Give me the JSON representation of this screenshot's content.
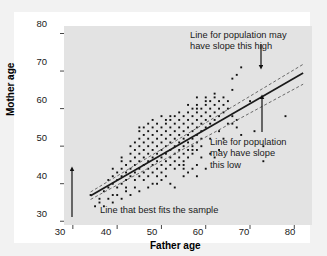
{
  "figure": {
    "panel_bg": "#e3e3e3",
    "card_bg": "#ffffff",
    "page_bg": "#f2f2f2"
  },
  "chart_data": {
    "type": "scatter",
    "title": "",
    "xlabel": "Father age",
    "ylabel": "Mother age",
    "xlim": [
      28,
      84
    ],
    "ylim": [
      29,
      82
    ],
    "xticks": [
      30,
      40,
      50,
      60,
      70,
      80
    ],
    "yticks": [
      30,
      40,
      50,
      60,
      70,
      80
    ],
    "grid": false,
    "legend": "none",
    "point_color": "#111111",
    "point_marker": "square",
    "annotations": [
      {
        "name": "upper-bound-label",
        "text": "Line for population may\nhave slope this high",
        "arrow": "down",
        "target": "upper-dashed-line"
      },
      {
        "name": "lower-bound-label",
        "text": "Line for population\nmay have slope\nthis low",
        "arrow": "up",
        "target": "lower-dashed-line"
      },
      {
        "name": "best-fit-label",
        "text": "Line that best fits the sample",
        "arrow": "up",
        "target": "regression-line"
      }
    ],
    "series": [
      {
        "name": "regression-line",
        "type": "line",
        "style": "solid",
        "color": "#1a1a1a",
        "x": [
          34,
          82
        ],
        "y": [
          36.8,
          69.5
        ]
      },
      {
        "name": "upper-dashed-line",
        "type": "line",
        "style": "dashed",
        "color": "#555555",
        "x": [
          34,
          82
        ],
        "y": [
          37.8,
          71.8
        ]
      },
      {
        "name": "lower-dashed-line",
        "type": "line",
        "style": "dashed",
        "color": "#555555",
        "x": [
          34,
          82
        ],
        "y": [
          35.8,
          66.5
        ]
      },
      {
        "name": "father-mother-age-points",
        "type": "scatter",
        "points": [
          [
            34,
            37
          ],
          [
            35,
            34
          ],
          [
            36,
            36
          ],
          [
            37,
            38
          ],
          [
            38,
            39
          ],
          [
            38,
            41
          ],
          [
            39,
            40
          ],
          [
            39,
            42
          ],
          [
            39,
            37
          ],
          [
            40,
            41
          ],
          [
            40,
            43
          ],
          [
            40,
            39
          ],
          [
            41,
            42
          ],
          [
            41,
            44
          ],
          [
            41,
            40
          ],
          [
            41,
            46
          ],
          [
            42,
            43
          ],
          [
            42,
            45
          ],
          [
            42,
            41
          ],
          [
            42,
            39
          ],
          [
            43,
            44
          ],
          [
            43,
            46
          ],
          [
            43,
            42
          ],
          [
            43,
            48
          ],
          [
            44,
            45
          ],
          [
            44,
            43
          ],
          [
            44,
            47
          ],
          [
            44,
            41
          ],
          [
            44,
            49
          ],
          [
            45,
            46
          ],
          [
            45,
            44
          ],
          [
            45,
            48
          ],
          [
            45,
            42
          ],
          [
            45,
            50
          ],
          [
            45,
            52
          ],
          [
            45,
            55
          ],
          [
            46,
            47
          ],
          [
            46,
            45
          ],
          [
            46,
            49
          ],
          [
            46,
            43
          ],
          [
            46,
            51
          ],
          [
            46,
            53
          ],
          [
            47,
            48
          ],
          [
            47,
            46
          ],
          [
            47,
            50
          ],
          [
            47,
            44
          ],
          [
            47,
            52
          ],
          [
            47,
            42
          ],
          [
            47,
            54
          ],
          [
            48,
            49
          ],
          [
            48,
            47
          ],
          [
            48,
            51
          ],
          [
            48,
            45
          ],
          [
            48,
            53
          ],
          [
            48,
            43
          ],
          [
            48,
            55
          ],
          [
            49,
            50
          ],
          [
            49,
            48
          ],
          [
            49,
            52
          ],
          [
            49,
            46
          ],
          [
            49,
            54
          ],
          [
            49,
            44
          ],
          [
            49,
            42
          ],
          [
            50,
            51
          ],
          [
            50,
            49
          ],
          [
            50,
            53
          ],
          [
            50,
            47
          ],
          [
            50,
            55
          ],
          [
            50,
            45
          ],
          [
            50,
            43
          ],
          [
            51,
            52
          ],
          [
            51,
            50
          ],
          [
            51,
            54
          ],
          [
            51,
            48
          ],
          [
            51,
            56
          ],
          [
            51,
            46
          ],
          [
            51,
            44
          ],
          [
            52,
            53
          ],
          [
            52,
            51
          ],
          [
            52,
            55
          ],
          [
            52,
            49
          ],
          [
            52,
            47
          ],
          [
            52,
            45
          ],
          [
            52,
            57
          ],
          [
            53,
            54
          ],
          [
            53,
            52
          ],
          [
            53,
            56
          ],
          [
            53,
            50
          ],
          [
            53,
            48
          ],
          [
            53,
            46
          ],
          [
            53,
            58
          ],
          [
            54,
            55
          ],
          [
            54,
            53
          ],
          [
            54,
            57
          ],
          [
            54,
            51
          ],
          [
            54,
            49
          ],
          [
            54,
            47
          ],
          [
            54,
            45
          ],
          [
            55,
            56
          ],
          [
            55,
            54
          ],
          [
            55,
            58
          ],
          [
            55,
            52
          ],
          [
            55,
            50
          ],
          [
            55,
            48
          ],
          [
            55,
            46
          ],
          [
            55,
            44
          ],
          [
            56,
            57
          ],
          [
            56,
            55
          ],
          [
            56,
            53
          ],
          [
            56,
            51
          ],
          [
            56,
            49
          ],
          [
            56,
            47
          ],
          [
            56,
            59
          ],
          [
            57,
            58
          ],
          [
            57,
            56
          ],
          [
            57,
            54
          ],
          [
            57,
            52
          ],
          [
            57,
            50
          ],
          [
            57,
            48
          ],
          [
            57,
            60
          ],
          [
            58,
            59
          ],
          [
            58,
            57
          ],
          [
            58,
            55
          ],
          [
            58,
            53
          ],
          [
            58,
            51
          ],
          [
            58,
            49
          ],
          [
            58,
            61
          ],
          [
            58,
            63
          ],
          [
            58,
            45
          ],
          [
            58,
            42
          ],
          [
            59,
            58
          ],
          [
            59,
            56
          ],
          [
            59,
            54
          ],
          [
            59,
            60
          ],
          [
            59,
            52
          ],
          [
            60,
            59
          ],
          [
            60,
            57
          ],
          [
            60,
            61
          ],
          [
            60,
            55
          ],
          [
            60,
            62
          ],
          [
            61,
            60
          ],
          [
            61,
            58
          ],
          [
            61,
            56
          ],
          [
            61,
            62
          ],
          [
            62,
            61
          ],
          [
            62,
            59
          ],
          [
            62,
            57
          ],
          [
            62,
            63
          ],
          [
            63,
            62
          ],
          [
            63,
            60
          ],
          [
            63,
            58
          ],
          [
            64,
            63
          ],
          [
            64,
            61
          ],
          [
            64,
            59
          ],
          [
            65,
            62
          ],
          [
            65,
            60
          ],
          [
            66,
            65
          ],
          [
            66,
            58
          ],
          [
            67,
            69
          ],
          [
            67,
            55
          ],
          [
            68,
            71
          ],
          [
            68,
            53
          ],
          [
            70,
            62
          ],
          [
            71,
            54
          ],
          [
            73,
            50
          ],
          [
            73,
            46
          ],
          [
            78,
            58
          ],
          [
            60,
            44
          ],
          [
            62,
            47
          ],
          [
            63,
            49
          ],
          [
            59,
            47
          ],
          [
            57,
            44
          ],
          [
            55,
            42
          ],
          [
            52,
            40
          ],
          [
            50,
            41
          ],
          [
            48,
            40
          ],
          [
            46,
            41
          ],
          [
            44,
            39
          ],
          [
            42,
            38
          ],
          [
            40,
            37
          ],
          [
            38,
            36
          ],
          [
            36,
            35
          ],
          [
            53,
            39
          ],
          [
            56,
            43
          ],
          [
            61,
            48
          ],
          [
            64,
            52
          ],
          [
            66,
            56
          ],
          [
            49,
            56
          ],
          [
            51,
            57
          ],
          [
            47,
            56
          ],
          [
            45,
            54
          ],
          [
            43,
            50
          ],
          [
            41,
            47
          ],
          [
            39,
            44
          ],
          [
            44,
            51
          ],
          [
            46,
            55
          ],
          [
            48,
            57
          ],
          [
            50,
            58
          ],
          [
            54,
            59
          ],
          [
            52,
            58
          ],
          [
            56,
            61
          ],
          [
            58,
            60
          ],
          [
            60,
            63
          ],
          [
            62,
            64
          ],
          [
            66,
            68
          ],
          [
            67,
            57
          ],
          [
            65,
            56
          ],
          [
            63,
            54
          ],
          [
            61,
            52
          ],
          [
            59,
            50
          ],
          [
            57,
            49
          ],
          [
            55,
            45
          ],
          [
            53,
            44
          ],
          [
            51,
            42
          ],
          [
            49,
            40
          ],
          [
            47,
            39
          ],
          [
            45,
            38
          ],
          [
            43,
            37
          ],
          [
            41,
            36
          ],
          [
            39,
            35
          ],
          [
            37,
            34
          ]
        ]
      }
    ]
  },
  "axes": {
    "x_ticks": [
      "30",
      "40",
      "50",
      "60",
      "70",
      "80"
    ],
    "y_ticks": [
      "30",
      "40",
      "50",
      "60",
      "70",
      "80"
    ],
    "x_title": "Father age",
    "y_title": "Mother age"
  },
  "annotations_text": {
    "high": "Line for population may\nhave slope this high",
    "low": "Line for population\nmay have slope\nthis low",
    "fit": "Line that best fits the sample"
  }
}
